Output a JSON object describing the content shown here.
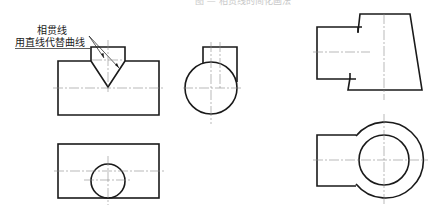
{
  "figure": {
    "caption_partial": "图 — 相贯线的简化画法",
    "annotations": {
      "line1": "相贯线",
      "line2": "用直线代替曲线"
    },
    "views": [
      {
        "id": "front-view-vee",
        "description": "front view: rectangle with V-shaped intersection of small prism"
      },
      {
        "id": "side-view-circle",
        "description": "side view: circle with small rectangle boss"
      },
      {
        "id": "top-view-rect-circle",
        "description": "top view: rectangle with circle"
      },
      {
        "id": "front-view-trapezoid",
        "description": "front view: trapezoid body with rectangular branch"
      },
      {
        "id": "top-view-ring",
        "description": "top view: concentric circles with rectangular branch"
      }
    ],
    "colors": {
      "line": "#1a1a1a",
      "centerline": "#8a8a8a",
      "background": "#ffffff"
    }
  }
}
